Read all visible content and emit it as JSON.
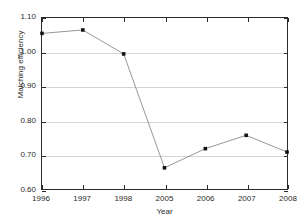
{
  "chart_data": {
    "type": "line",
    "title": "",
    "xlabel": "Year",
    "ylabel": "Matching efficiency",
    "categories": [
      "1996",
      "1997",
      "1998",
      "2005",
      "2006",
      "2007",
      "2008"
    ],
    "values": [
      1.055,
      1.065,
      0.995,
      0.662,
      0.718,
      0.757,
      0.708
    ],
    "series": [
      {
        "name": "Matching efficiency",
        "values": [
          1.055,
          1.065,
          0.995,
          0.662,
          0.718,
          0.757,
          0.708
        ]
      }
    ],
    "ylim": [
      0.6,
      1.1
    ],
    "ytick_step": 0.1,
    "yticks": [
      "0.60",
      "0.70",
      "0.80",
      "0.90",
      "1.00",
      "1.10"
    ],
    "ytick_values": [
      0.6,
      0.7,
      0.8,
      0.9,
      1.0,
      1.1
    ],
    "xticks": [
      "1996",
      "1997",
      "1998",
      "2005",
      "2006",
      "2007",
      "2008"
    ],
    "grid": "horizontal",
    "legend": "none",
    "marker": "filled-square",
    "line_color": "#8a8a8a",
    "marker_color": "#111111",
    "grid_color": "#d4d4d4",
    "axis_color": "#2b2b2b",
    "background": "#ffffff",
    "annotations": []
  }
}
